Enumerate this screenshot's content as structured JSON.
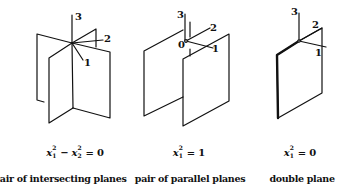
{
  "figures": [
    {
      "id": "intersecting",
      "axis_labels": {
        "x1": "1",
        "x2": "2",
        "x3": "3"
      },
      "equation": {
        "lhs_var1": "x",
        "lhs_sub1": "1",
        "lhs_sup1": "2",
        "operator": "−",
        "lhs_var2": "x",
        "lhs_sub2": "2",
        "lhs_sup2": "2",
        "equals": "=",
        "rhs": "0"
      },
      "caption": "pair of intersecting planes"
    },
    {
      "id": "parallel",
      "axis_labels": {
        "x1": "1",
        "x2": "2",
        "x3": "3",
        "origin": "0"
      },
      "equation": {
        "lhs_var1": "x",
        "lhs_sub1": "1",
        "lhs_sup1": "2",
        "equals": "=",
        "rhs": "1"
      },
      "caption": "pair of parallel planes"
    },
    {
      "id": "double",
      "axis_labels": {
        "x1": "1",
        "x2": "2",
        "x3": "3"
      },
      "equation": {
        "lhs_var1": "x",
        "lhs_sub1": "1",
        "lhs_sup1": "2",
        "equals": "=",
        "rhs": "0"
      },
      "caption": "double plane"
    }
  ],
  "colors": {
    "line": "#111111",
    "background": "#ffffff"
  }
}
